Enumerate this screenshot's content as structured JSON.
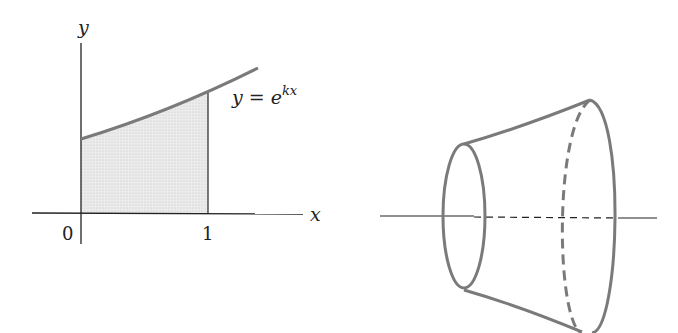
{
  "left_figure": {
    "y_axis_label": "y",
    "x_axis_label": "x",
    "origin_label": "0",
    "x_tick_label": "1",
    "curve_label_lhs": "y = e",
    "curve_label_exp": "kx",
    "shaded_region": "area under y = e^{kx} from x = 0 to x = 1"
  },
  "right_figure": {
    "description": "solid of revolution (frustum-like) about the x-axis",
    "axis": "horizontal axis of rotation"
  },
  "colors": {
    "curve": "#7a7a7a",
    "axis": "#222222",
    "shade": "#e6e6e6"
  }
}
